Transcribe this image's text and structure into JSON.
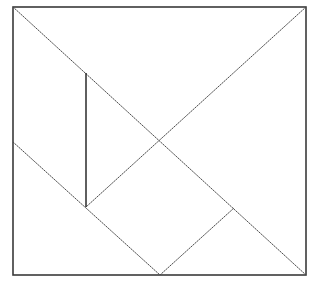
{
  "diagram": {
    "type": "geometric-line-drawing",
    "colors": {
      "background": "#ffffff",
      "frame": "#3a3a3a",
      "lines": "#4a4a4a"
    },
    "frame": {
      "x1": 13,
      "y1": 7,
      "x2": 306,
      "y2": 275
    },
    "points": {
      "top_left": [
        13,
        7
      ],
      "top_right": [
        306,
        7
      ],
      "bottom_left": [
        13,
        275
      ],
      "bottom_right": [
        306,
        275
      ],
      "center": [
        160,
        140
      ],
      "vertical_top": [
        86,
        73
      ],
      "vertical_bottom": [
        86,
        207
      ],
      "left_mid": [
        13,
        142
      ],
      "bottom_mid": [
        160,
        275
      ],
      "right_inner": [
        234,
        208
      ]
    },
    "segments": [
      {
        "name": "main-diagonal-tl-br",
        "from": "top_left",
        "to": "bottom_right",
        "style": "dotted"
      },
      {
        "name": "diagonal-tr-to-inner",
        "from": "top_right",
        "to": "vertical_bottom",
        "style": "dotted"
      },
      {
        "name": "vertical-divider",
        "from": "vertical_top",
        "to": "vertical_bottom",
        "style": "solid"
      },
      {
        "name": "lower-left-diagonal",
        "from": "left_mid",
        "to": "bottom_mid",
        "style": "dotted"
      },
      {
        "name": "lower-right-diagonal",
        "from": "bottom_mid",
        "to": "right_inner",
        "style": "dotted"
      }
    ]
  }
}
